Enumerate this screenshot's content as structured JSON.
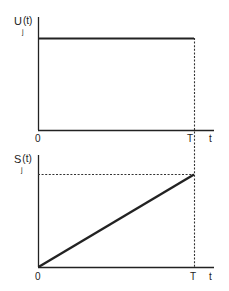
{
  "colors": {
    "line": "#222222",
    "background": "#ffffff"
  },
  "top_plot": {
    "ylabel": "U",
    "ylabel_sub": "j",
    "ylabel_arg": "(t)",
    "x_origin_label": "0",
    "x_T_label": "T",
    "x_axis_label": "t",
    "description": "Constant level from 0 to T"
  },
  "bottom_plot": {
    "ylabel": "S",
    "ylabel_sub": "j",
    "ylabel_arg": "(t)",
    "x_origin_label": "0",
    "x_T_label": "T",
    "x_axis_label": "t",
    "description": "Linear ramp from 0 at t=0 up to peak at t=T"
  }
}
